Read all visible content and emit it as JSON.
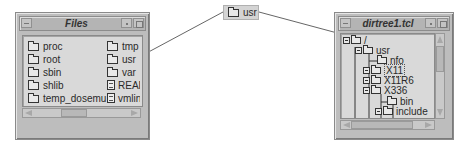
{
  "files_window": {
    "title": "Files",
    "items_col1": [
      {
        "name": "proc",
        "icon": "folder-icon"
      },
      {
        "name": "root",
        "icon": "folder-icon"
      },
      {
        "name": "sbin",
        "icon": "folder-icon"
      },
      {
        "name": "shlib",
        "icon": "folder-icon"
      },
      {
        "name": "temp_dosemu",
        "icon": "folder-icon"
      }
    ],
    "items_col2": [
      {
        "name": "tmp",
        "icon": "folder-icon"
      },
      {
        "name": "usr",
        "icon": "folder-icon"
      },
      {
        "name": "var",
        "icon": "folder-icon"
      },
      {
        "name": "READ",
        "icon": "document-icon"
      },
      {
        "name": "vmlinu",
        "icon": "document-icon"
      }
    ]
  },
  "drag_label": {
    "text": "usr",
    "icon": "folder-icon"
  },
  "dirtree_window": {
    "title": "dirtree1.tcl",
    "tree": [
      {
        "label": "/",
        "depth": 0,
        "expander": true
      },
      {
        "label": "usr",
        "depth": 1,
        "expander": true
      },
      {
        "label": "nfo",
        "depth": 2,
        "expander": false
      },
      {
        "label": "X11",
        "depth": 2,
        "expander": true,
        "selected": true
      },
      {
        "label": "X11R6",
        "depth": 2,
        "expander": true
      },
      {
        "label": "X336",
        "depth": 2,
        "expander": true
      },
      {
        "label": "bin",
        "depth": 3,
        "expander": false
      },
      {
        "label": "include",
        "depth": 3,
        "expander": true
      },
      {
        "label": "lib",
        "depth": 3,
        "expander": true
      },
      {
        "label": "X11",
        "depth": 4,
        "expander": true
      },
      {
        "label": "fonts",
        "depth": 4,
        "expander": true
      }
    ]
  },
  "colors": {
    "window_bg": "#bdbdbd",
    "pane_bg": "#d9d9d9",
    "drag_line": "#555555"
  }
}
